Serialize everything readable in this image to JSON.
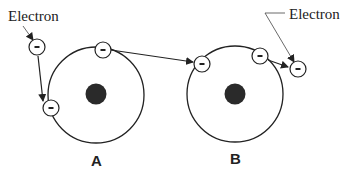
{
  "diagram": {
    "labels": {
      "electron_left": "Electron",
      "electron_right": "Electron",
      "atom_a": "A",
      "atom_b": "B"
    },
    "electron_symbol": "–",
    "colors": {
      "line": "#222222",
      "nucleus": "#2a2a2a",
      "background": "#ffffff"
    },
    "atoms": [
      {
        "id": "A",
        "center": [
          96,
          95
        ],
        "radius": 48,
        "electrons": 2
      },
      {
        "id": "B",
        "center": [
          235,
          94
        ],
        "radius": 48,
        "electrons": 2
      }
    ],
    "free_electrons": 2
  }
}
